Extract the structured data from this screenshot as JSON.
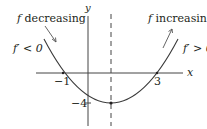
{
  "diagram": {
    "left_label_f": "f",
    "left_label_text": " decreasing",
    "right_label_f": "f",
    "right_label_text": " increasing",
    "left_deriv": "f′ < 0",
    "right_deriv": "f′ > 0",
    "x_axis_label": "x",
    "y_axis_label": "y",
    "tick_neg1": "−1",
    "tick_3": "3",
    "tick_neg4": "−4",
    "colors": {
      "ink": "#231f20",
      "curve": "#3a3a3a"
    }
  }
}
